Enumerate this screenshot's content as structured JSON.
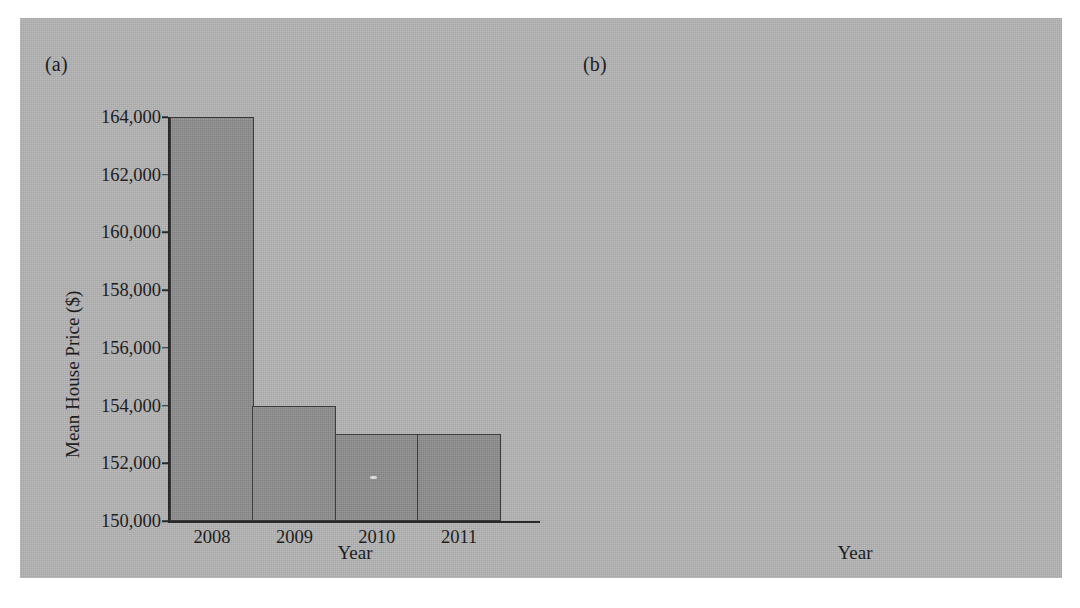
{
  "figure": {
    "background_color": "#b4b4b4",
    "bar_fill_color": "#8d8d8d",
    "bar_edge_color": "#3a3a3a",
    "text_color": "#1d1d1d"
  },
  "panels": [
    {
      "tag": "(a)",
      "xlabel": "Year",
      "ylabel": "Mean House Price ($)"
    },
    {
      "tag": "(b)",
      "xlabel": "Year",
      "ylabel": "Mean House Price ($)"
    }
  ],
  "chart_data": [
    {
      "type": "bar",
      "panel": "(a)",
      "title": "",
      "xlabel": "Year",
      "ylabel": "Mean House Price ($)",
      "categories": [
        "2008",
        "2009",
        "2010",
        "2011"
      ],
      "values": [
        164000,
        154000,
        153000,
        153000
      ],
      "ylim": [
        150000,
        164000
      ],
      "ytick_values": [
        150000,
        152000,
        154000,
        156000,
        158000,
        160000,
        162000,
        164000
      ],
      "ytick_labels": [
        "150,000",
        "152,000",
        "154,000",
        "156,000",
        "158,000",
        "160,000",
        "162,000",
        "164,000"
      ],
      "grid": false,
      "legend": null,
      "note": "truncated y-axis starting at 150,000"
    },
    {
      "type": "bar",
      "panel": "(b)",
      "title": "",
      "xlabel": "Year",
      "ylabel": "Mean House Price ($)",
      "categories": [
        "2008",
        "2009",
        "2010",
        "2011"
      ],
      "values": [
        164000,
        154000,
        153000,
        153000
      ],
      "ylim": [
        0,
        175000
      ],
      "ytick_values": [
        0,
        25000,
        50000,
        75000,
        100000,
        125000,
        150000,
        175000
      ],
      "ytick_labels": [
        "0",
        "25,000",
        "50,000",
        "75,000",
        "100,000",
        "125,000",
        "150,000",
        "175,000"
      ],
      "grid": false,
      "legend": null,
      "note": "full y-axis starting at 0"
    }
  ]
}
